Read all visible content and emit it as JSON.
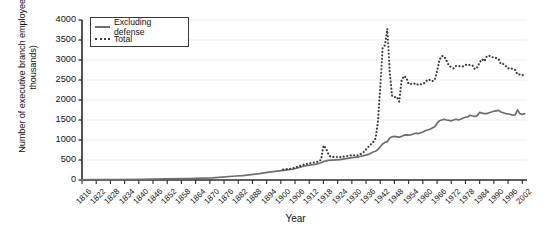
{
  "chart_data": {
    "type": "line",
    "title": "",
    "xlabel": "Year",
    "ylabel": "Number of executive branch employees (in thousands)",
    "xlim": [
      1816,
      2004
    ],
    "ylim": [
      0,
      4000
    ],
    "ytick_step": 500,
    "grid": "horizontal-light",
    "legend_position": "top-left-inside",
    "ytick_labels": [
      "0",
      "500",
      "1000",
      "1500",
      "2000",
      "2500",
      "3000",
      "3500",
      "4000"
    ],
    "xtick_labels": [
      "1816",
      "1822",
      "1828",
      "1834",
      "1840",
      "1846",
      "1852",
      "1858",
      "1864",
      "1870",
      "1876",
      "1882",
      "1888",
      "1894",
      "1900",
      "1906",
      "1912",
      "1918",
      "1924",
      "1930",
      "1936",
      "1942",
      "1948",
      "1954",
      "1960",
      "1966",
      "1972",
      "1978",
      "1984",
      "1990",
      "1996",
      "2002"
    ],
    "series": [
      {
        "name": "Excluding defense",
        "style": "solid",
        "color": "#6e6e6e",
        "x": [
          1816,
          1821,
          1831,
          1841,
          1851,
          1861,
          1871,
          1881,
          1884,
          1891,
          1895,
          1901,
          1905,
          1910,
          1915,
          1917,
          1918,
          1920,
          1925,
          1930,
          1933,
          1935,
          1937,
          1939,
          1940,
          1941,
          1942,
          1943,
          1944,
          1945,
          1946,
          1947,
          1948,
          1949,
          1950,
          1951,
          1952,
          1953,
          1954,
          1955,
          1956,
          1957,
          1958,
          1959,
          1960,
          1961,
          1962,
          1963,
          1964,
          1965,
          1966,
          1967,
          1968,
          1969,
          1970,
          1971,
          1972,
          1973,
          1974,
          1975,
          1976,
          1977,
          1978,
          1979,
          1980,
          1981,
          1982,
          1983,
          1984,
          1985,
          1986,
          1987,
          1988,
          1989,
          1990,
          1991,
          1992,
          1993,
          1994,
          1995,
          1996,
          1997,
          1998,
          1999,
          2000,
          2001,
          2002,
          2003
        ],
        "values": [
          5,
          7,
          11,
          18,
          26,
          37,
          51,
          100,
          110,
          158,
          196,
          240,
          268,
          350,
          395,
          430,
          460,
          490,
          510,
          560,
          580,
          610,
          640,
          700,
          720,
          760,
          830,
          900,
          940,
          960,
          1050,
          1080,
          1090,
          1080,
          1070,
          1090,
          1120,
          1130,
          1120,
          1130,
          1150,
          1170,
          1160,
          1180,
          1200,
          1230,
          1250,
          1270,
          1300,
          1330,
          1420,
          1480,
          1500,
          1520,
          1500,
          1490,
          1480,
          1500,
          1520,
          1500,
          1520,
          1550,
          1570,
          1580,
          1620,
          1600,
          1590,
          1610,
          1690,
          1670,
          1660,
          1660,
          1680,
          1700,
          1720,
          1730,
          1740,
          1700,
          1680,
          1660,
          1650,
          1640,
          1620,
          1630,
          1750,
          1660,
          1640,
          1660
        ]
      },
      {
        "name": "Total",
        "style": "dotted",
        "color": "#3c3c3c",
        "x": [
          1901,
          1905,
          1910,
          1915,
          1916,
          1917,
          1918,
          1919,
          1920,
          1921,
          1925,
          1930,
          1933,
          1935,
          1937,
          1939,
          1940,
          1941,
          1942,
          1943,
          1944,
          1945,
          1946,
          1947,
          1948,
          1949,
          1950,
          1951,
          1952,
          1953,
          1954,
          1955,
          1956,
          1957,
          1958,
          1959,
          1960,
          1961,
          1962,
          1963,
          1964,
          1965,
          1966,
          1967,
          1968,
          1969,
          1970,
          1971,
          1972,
          1973,
          1974,
          1975,
          1976,
          1977,
          1978,
          1979,
          1980,
          1981,
          1982,
          1983,
          1984,
          1985,
          1986,
          1987,
          1988,
          1989,
          1990,
          1991,
          1992,
          1993,
          1994,
          1995,
          1996,
          1997,
          1998,
          1999,
          2000,
          2001,
          2002,
          2003
        ],
        "values": [
          260,
          290,
          390,
          450,
          460,
          510,
          860,
          800,
          660,
          580,
          570,
          620,
          620,
          700,
          830,
          950,
          1040,
          1440,
          2300,
          3300,
          3370,
          3780,
          2700,
          2110,
          2070,
          2080,
          1960,
          2480,
          2600,
          2560,
          2400,
          2400,
          2400,
          2420,
          2380,
          2390,
          2400,
          2440,
          2510,
          2500,
          2470,
          2500,
          2720,
          3000,
          3100,
          3090,
          2980,
          2860,
          2820,
          2790,
          2850,
          2850,
          2840,
          2840,
          2880,
          2870,
          2880,
          2860,
          2770,
          2820,
          2940,
          3020,
          2970,
          3090,
          3110,
          3070,
          3070,
          3050,
          3020,
          2900,
          2900,
          2850,
          2790,
          2800,
          2770,
          2750,
          2640,
          2640,
          2630,
          2600
        ]
      }
    ]
  }
}
